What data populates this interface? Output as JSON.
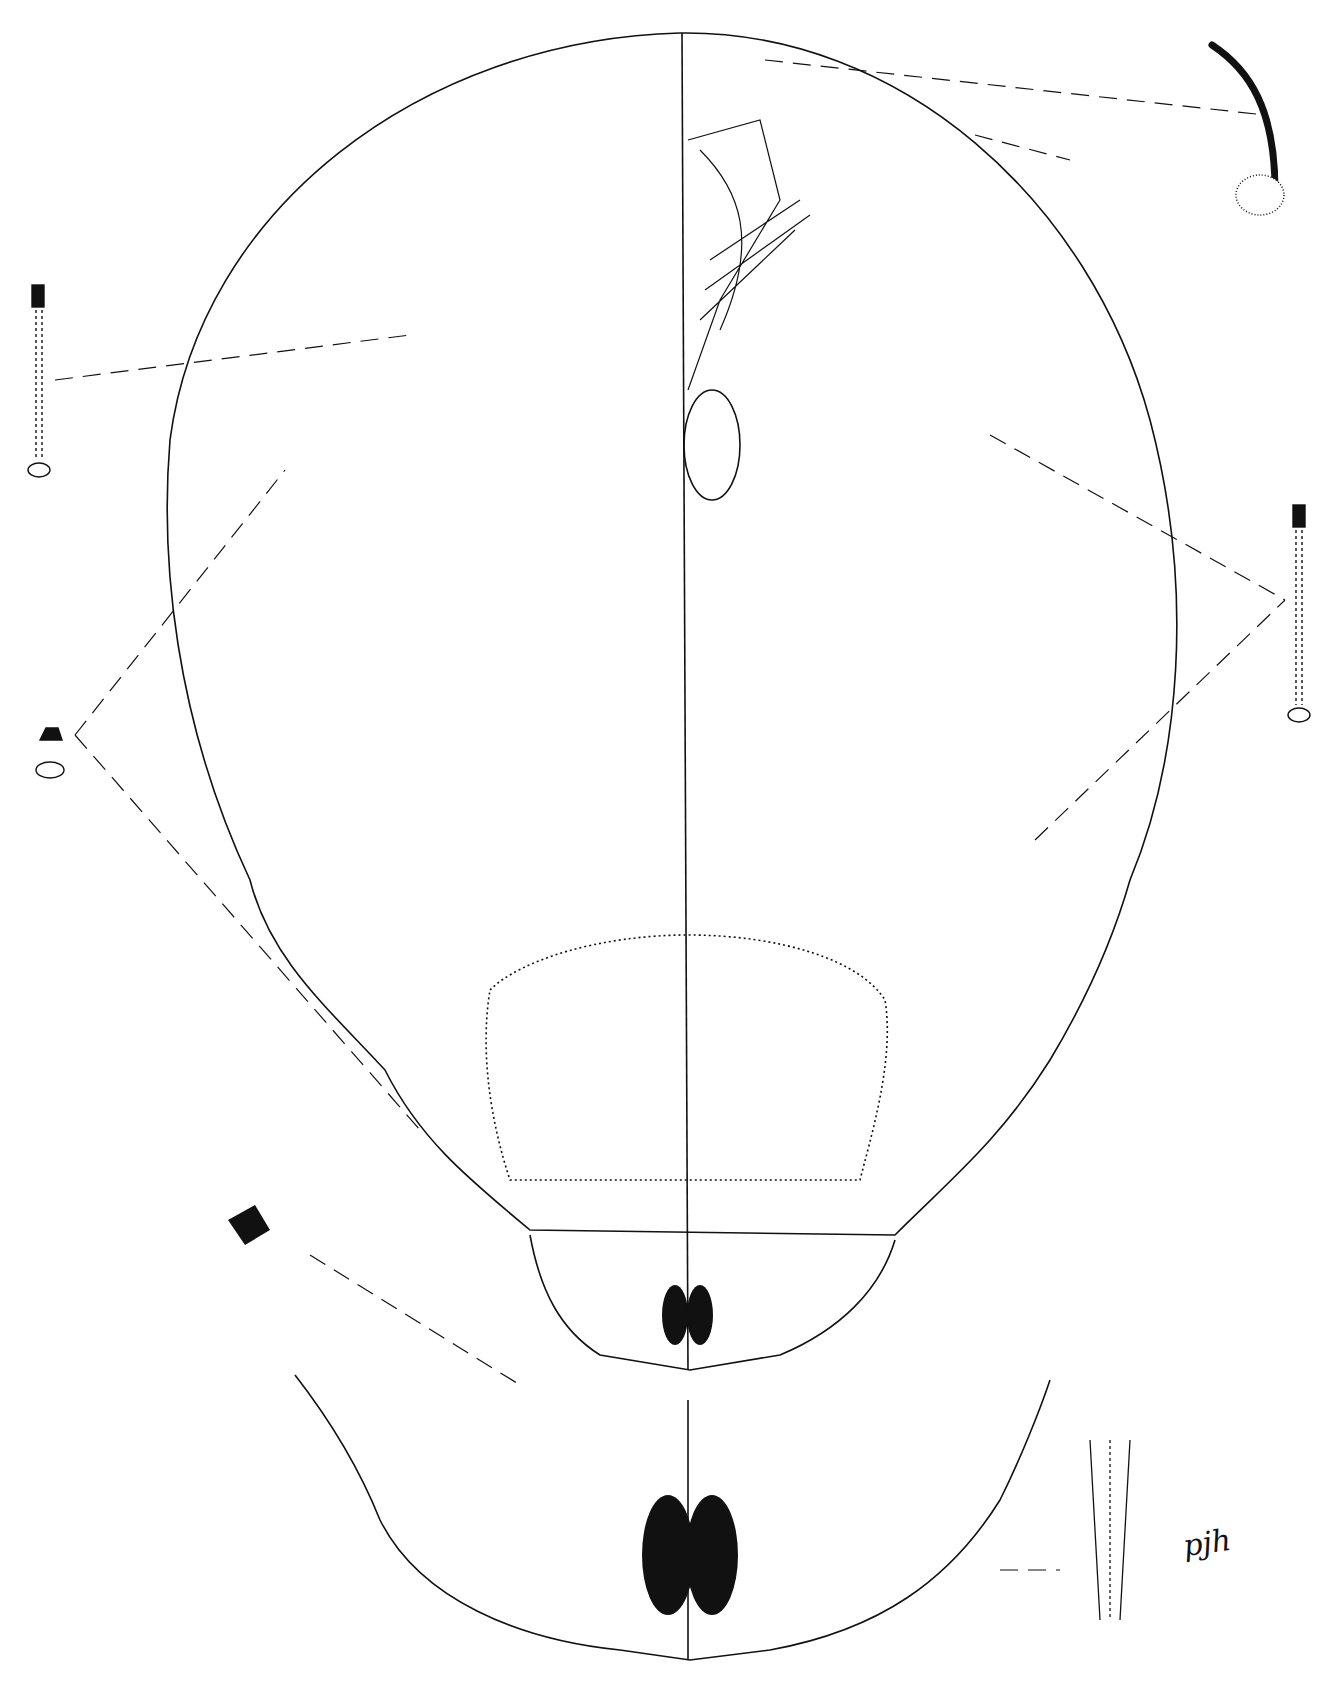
{
  "figure": {
    "signature": "pjh",
    "colors": {
      "ink": "#111111",
      "background": "#ffffff"
    },
    "insets": [
      {
        "name": "dorsal-seta-detail",
        "position": "top-right"
      },
      {
        "name": "tubular-duct-detail-left-upper",
        "position": "left-upper"
      },
      {
        "name": "tubular-duct-detail-right",
        "position": "right-middle"
      },
      {
        "name": "pore-detail-left",
        "position": "left-middle"
      },
      {
        "name": "marginal-duct-detail-left",
        "position": "left-lower"
      },
      {
        "name": "anal-lobe-enlarged",
        "position": "bottom"
      },
      {
        "name": "fringe-projection-detail",
        "position": "bottom-right"
      }
    ]
  }
}
